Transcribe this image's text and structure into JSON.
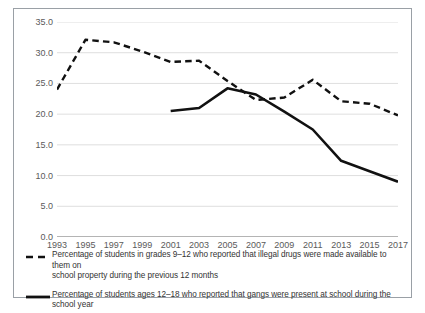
{
  "chart_data": {
    "type": "line",
    "title": "",
    "xlabel": "",
    "ylabel": "",
    "x": [
      1993,
      1994,
      1995,
      1996,
      1997,
      1998,
      1999,
      2000,
      2001,
      2002,
      2003,
      2004,
      2005,
      2006,
      2007,
      2008,
      2009,
      2010,
      2011,
      2012,
      2013,
      2014,
      2015,
      2016,
      2017
    ],
    "xticks": [
      "1993",
      "1995",
      "1997",
      "1999",
      "2001",
      "2003",
      "2005",
      "2007",
      "2009",
      "2011",
      "2013",
      "2015",
      "2017"
    ],
    "yticks": [
      "0.0",
      "5.0",
      "10.0",
      "15.0",
      "20.0",
      "25.0",
      "30.0",
      "35.0"
    ],
    "ylim": [
      0,
      35
    ],
    "xlim": [
      1993,
      2017
    ],
    "grid": true,
    "legend_position": "below",
    "series": [
      {
        "name": "drugs-available",
        "style": "dashed",
        "color": "#111111",
        "legend": "Percentage of students in grades 9–12 who reported that illegal drugs were made available to them on school property during the previous 12 months",
        "legend_line1": "Percentage of students in grades 9–12 who reported that illegal drugs were made available to them on",
        "legend_line2": "school property during the previous 12 months",
        "x": [
          1993,
          1995,
          1997,
          1999,
          2001,
          2003,
          2005,
          2007,
          2009,
          2011,
          2013,
          2015,
          2017
        ],
        "values": [
          24.0,
          32.1,
          31.7,
          30.2,
          28.5,
          28.7,
          25.4,
          22.3,
          22.7,
          25.6,
          22.1,
          21.7,
          19.8
        ]
      },
      {
        "name": "gangs-present",
        "style": "solid",
        "color": "#111111",
        "legend": "Percentage of students ages 12–18 who reported that gangs were present at school during the school year",
        "legend_line1": "Percentage of students ages 12–18 who reported that gangs were present at school during the school year",
        "legend_line2": "",
        "x": [
          2001,
          2003,
          2005,
          2007,
          2009,
          2011,
          2013,
          2015,
          2017
        ],
        "values": [
          20.5,
          21.0,
          24.2,
          23.2,
          20.4,
          17.5,
          12.4,
          10.7,
          9.0
        ]
      }
    ]
  }
}
